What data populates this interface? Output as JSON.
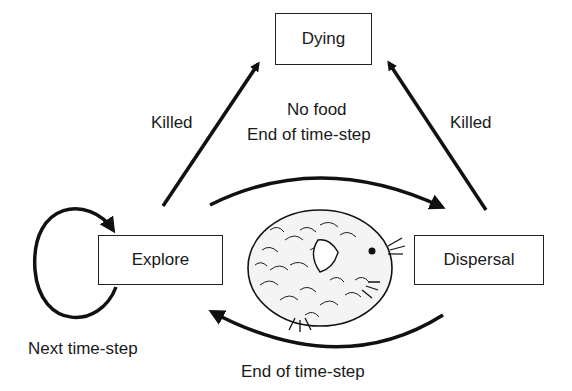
{
  "diagram": {
    "nodes": {
      "dying": "Dying",
      "explore": "Explore",
      "dispersal": "Dispersal"
    },
    "edges": {
      "explore_to_dying": "Killed",
      "dispersal_to_dying": "Killed",
      "explore_to_dispersal_line1": "No food",
      "explore_to_dispersal_line2": "End of time-step",
      "dispersal_to_explore": "End of time-step",
      "explore_self_loop": "Next time-step"
    },
    "illustration": "lemming-drawing"
  }
}
